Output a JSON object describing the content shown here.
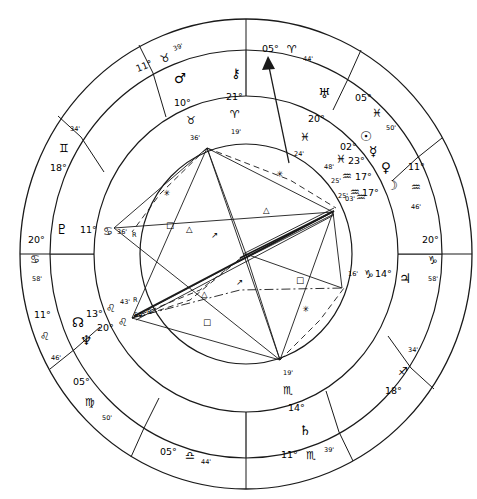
{
  "chart": {
    "type": "astrological-wheel",
    "geometry": {
      "center_x": 246,
      "center_y": 254,
      "r_outer": 222,
      "r_mid": 190,
      "r_inner": 148,
      "r_core": 118
    },
    "colors": {
      "stroke": "#1a1a1a",
      "background": "#ffffff"
    }
  },
  "signs": {
    "aries": "♈",
    "taurus": "♉",
    "gemini": "♊",
    "cancer": "♋",
    "leo": "♌",
    "virgo": "♍",
    "libra": "♎",
    "scorpio": "♏",
    "sagittarius": "♐",
    "capricorn": "♑",
    "aquarius": "♒",
    "pisces": "♓"
  },
  "planet_glyphs": {
    "sun": "☉",
    "moon": "☽",
    "mercury": "☿",
    "venus": "♀",
    "mars": "♂",
    "jupiter": "♃",
    "saturn": "♄",
    "uranus": "♅",
    "neptune": "♆",
    "pluto": "♇",
    "chiron": "⚷",
    "north_node": "☊"
  },
  "aspect_glyphs": {
    "square": "□",
    "trine": "△",
    "sextile": "✳",
    "semisextile": "↗"
  },
  "cusps": [
    {
      "name": "ascendant",
      "label": "ASC",
      "deg": "20°",
      "sign": "♋",
      "min": "58'",
      "position_deg": 180
    },
    {
      "name": "mc",
      "label": "MC",
      "deg": "05°",
      "sign": "♈",
      "min": "44'",
      "position_deg": 90
    },
    {
      "name": "descendant",
      "label": "DSC",
      "deg": "20°",
      "sign": "♑",
      "min": "58'",
      "position_deg": 0
    },
    {
      "name": "ic",
      "label": "IC",
      "deg": "05°",
      "sign": "♎",
      "min": "44'",
      "position_deg": 270
    },
    {
      "name": "house-11",
      "label": "11",
      "deg": "11°",
      "sign": "♉",
      "min": "39'",
      "position_deg": 118
    },
    {
      "name": "house-12",
      "label": "12",
      "deg": "18°",
      "sign": "♊",
      "min": "34'",
      "position_deg": 148
    },
    {
      "name": "house-2",
      "label": "2",
      "deg": "11°",
      "sign": "♌",
      "min": "46'",
      "position_deg": 208
    },
    {
      "name": "house-3",
      "label": "3",
      "deg": "05°",
      "sign": "♍",
      "min": "50'",
      "position_deg": 238
    },
    {
      "name": "house-5",
      "label": "5",
      "deg": "11°",
      "sign": "♏",
      "min": "39'",
      "position_deg": 298
    },
    {
      "name": "house-6",
      "label": "6",
      "deg": "18°",
      "sign": "♐",
      "min": "34'",
      "position_deg": 328
    },
    {
      "name": "house-8",
      "label": "8",
      "deg": "11°",
      "sign": "♒",
      "min": "46'",
      "position_deg": 28
    },
    {
      "name": "house-9",
      "label": "9",
      "deg": "05°",
      "sign": "♓",
      "min": "50'",
      "position_deg": 58
    }
  ],
  "planets": [
    {
      "name": "mars",
      "glyph": "♂",
      "deg": "10°",
      "sign": "♉",
      "min": "36'",
      "retrograde": ""
    },
    {
      "name": "chiron",
      "glyph": "⚷",
      "deg": "21°",
      "sign": "♈",
      "min": "19'",
      "retrograde": ""
    },
    {
      "name": "uranus",
      "glyph": "♅",
      "deg": "20°",
      "sign": "♓",
      "min": "24'",
      "retrograde": ""
    },
    {
      "name": "sun",
      "glyph": "☉",
      "deg": "02°",
      "sign": "♓",
      "min": "48'",
      "retrograde": ""
    },
    {
      "name": "mercury",
      "glyph": "☿",
      "deg": "23°",
      "sign": "♒",
      "min": "25'",
      "retrograde": ""
    },
    {
      "name": "venus",
      "glyph": "♀",
      "deg": "17°",
      "sign": "♒",
      "min": "25'",
      "retrograde": ""
    },
    {
      "name": "moon",
      "glyph": "☽",
      "deg": "17°",
      "sign": "♒",
      "min": "03'",
      "retrograde": ""
    },
    {
      "name": "jupiter",
      "glyph": "♃",
      "deg": "14°",
      "sign": "♑",
      "min": "16'",
      "retrograde": ""
    },
    {
      "name": "saturn",
      "glyph": "♄",
      "deg": "14°",
      "sign": "♏",
      "min": "19'",
      "retrograde": ""
    },
    {
      "name": "north-node",
      "glyph": "☊",
      "deg": "20°",
      "sign": "♌",
      "min": "54'",
      "retrograde": "R"
    },
    {
      "name": "neptune",
      "glyph": "♆",
      "deg": "13°",
      "sign": "♌",
      "min": "43'",
      "retrograde": "R"
    },
    {
      "name": "pluto",
      "glyph": "♇",
      "deg": "11°",
      "sign": "♋",
      "min": "36'",
      "retrograde": "R"
    }
  ],
  "labels": {
    "mc": {
      "deg": "05°",
      "sign": "♈",
      "min": "44'"
    },
    "ic": {
      "deg": "05°",
      "sign": "♎",
      "min": "44'"
    },
    "asc": {
      "deg": "20°",
      "sign": "♋",
      "min": "58'"
    },
    "dsc": {
      "deg": "20°",
      "sign": "♑",
      "min": "58'"
    },
    "h11": {
      "deg": "11°",
      "sign": "♉",
      "min": "39'"
    },
    "h12": {
      "deg": "18°",
      "sign": "♊",
      "min": "34'"
    },
    "h2": {
      "deg": "11°",
      "sign": "♌",
      "min": "46'"
    },
    "h3": {
      "deg": "05°",
      "sign": "♍",
      "min": "50'"
    },
    "h5": {
      "deg": "11°",
      "sign": "♏",
      "min": "39'"
    },
    "h6": {
      "deg": "18°",
      "sign": "♐",
      "min": "34'"
    },
    "h8": {
      "deg": "11°",
      "sign": "♒",
      "min": "46'"
    },
    "h9": {
      "deg": "05°",
      "sign": "♓",
      "min": "50'"
    }
  },
  "planet_text": {
    "mars": {
      "glyph": "♂",
      "deg": "10°",
      "sign": "♉",
      "min": "36'"
    },
    "chiron": {
      "glyph": "⚷",
      "deg": "21°",
      "sign": "♈",
      "min": "19'"
    },
    "uranus": {
      "glyph": "♅",
      "deg": "20°",
      "sign": "♓",
      "min": "24'"
    },
    "sun": {
      "glyph": "☉",
      "deg": "02°",
      "sign": "♓",
      "min": "48'"
    },
    "mercury": {
      "glyph": "☿",
      "deg": "23°",
      "sign": "♒",
      "min": "25'"
    },
    "venus": {
      "glyph": "♀",
      "deg": "17°",
      "sign": "♒",
      "min": "25'"
    },
    "moon": {
      "glyph": "☽",
      "deg": "17°",
      "sign": "♒",
      "min": "03'"
    },
    "jupiter": {
      "glyph": "♃",
      "deg": "14°",
      "sign": "♑",
      "min": "16'"
    },
    "saturn": {
      "glyph": "♄",
      "deg": "14°",
      "sign": "♏",
      "min": "19'"
    },
    "node": {
      "glyph": "☊",
      "deg": "20°",
      "sign": "♌",
      "min": "54'",
      "rx": "R"
    },
    "neptune": {
      "glyph": "♆",
      "deg": "13°",
      "sign": "♌",
      "min": "43'",
      "rx": "R"
    },
    "pluto": {
      "glyph": "♇",
      "deg": "11°",
      "sign": "♋",
      "min": "36'",
      "rx": "R"
    }
  },
  "aspects_marks": [
    {
      "name": "sextile-1",
      "glyph": "✳"
    },
    {
      "name": "square-1",
      "glyph": "□"
    },
    {
      "name": "trine-1",
      "glyph": "△"
    },
    {
      "name": "semisextile-1",
      "glyph": "↗"
    },
    {
      "name": "sextile-2",
      "glyph": "✳"
    },
    {
      "name": "trine-2",
      "glyph": "△"
    },
    {
      "name": "square-2",
      "glyph": "□"
    },
    {
      "name": "semisextile-2",
      "glyph": "↗"
    },
    {
      "name": "trine-3",
      "glyph": "△"
    },
    {
      "name": "square-3",
      "glyph": "□"
    },
    {
      "name": "sextile-3",
      "glyph": "✳"
    }
  ]
}
